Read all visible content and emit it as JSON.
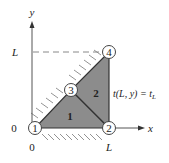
{
  "diagram": {
    "type": "finite-element-mesh",
    "axes": {
      "x_label": "x",
      "y_label": "y",
      "x_ticks": [
        "0",
        "L"
      ],
      "y_ticks": [
        "0",
        "L"
      ]
    },
    "nodes": [
      {
        "id": "1",
        "x": "0",
        "y": "0"
      },
      {
        "id": "2",
        "x": "L",
        "y": "0"
      },
      {
        "id": "3",
        "x": "L/2",
        "y": "L/2"
      },
      {
        "id": "4",
        "x": "L",
        "y": "L"
      }
    ],
    "elements": [
      {
        "id": "1",
        "nodes": [
          "1",
          "2",
          "3"
        ]
      },
      {
        "id": "2",
        "nodes": [
          "2",
          "4",
          "3"
        ]
      }
    ],
    "boundary_condition": {
      "label_main": "t(L, y) = t",
      "label_sub": "L"
    },
    "colors": {
      "fill": "#8c8c8c",
      "stroke": "#333333",
      "background": "#ffffff"
    }
  }
}
